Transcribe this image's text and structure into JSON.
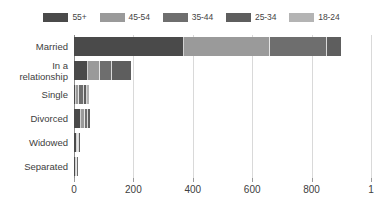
{
  "chart_data": {
    "type": "bar",
    "orientation": "horizontal",
    "stacked": true,
    "title": "",
    "subtitle": "",
    "xlabel": "",
    "ylabel": "",
    "xlim": [
      0,
      1000
    ],
    "grid": true,
    "legend_position": "top",
    "categories": [
      "Married",
      "In a relationship",
      "Single",
      "Divorced",
      "Widowed",
      "Separated"
    ],
    "category_lines": [
      [
        "Married"
      ],
      [
        "In a",
        "relationship"
      ],
      [
        "Single"
      ],
      [
        "Divorced"
      ],
      [
        "Widowed"
      ],
      [
        "Separated"
      ]
    ],
    "xticks": [
      0,
      200,
      400,
      600,
      800,
      1000
    ],
    "xtick_labels": [
      "0",
      "200",
      "400",
      "600",
      "800",
      "1"
    ],
    "series": [
      {
        "name": "55+",
        "color": "#4a4a4a",
        "values": [
          370,
          47,
          6,
          22,
          10,
          8
        ]
      },
      {
        "name": "45-54",
        "color": "#9a9a9a",
        "values": [
          290,
          40,
          12,
          16,
          4,
          2
        ]
      },
      {
        "name": "35-44",
        "color": "#6e6e6e",
        "values": [
          192,
          40,
          14,
          10,
          2,
          1
        ]
      },
      {
        "name": "25-34",
        "color": "#5e5e5e",
        "values": [
          47,
          64,
          12,
          6,
          1,
          0
        ]
      },
      {
        "name": "18-24",
        "color": "#b4b4b4",
        "values": [
          0,
          0,
          8,
          0,
          0,
          0
        ]
      }
    ],
    "totals": [
      899,
      191,
      52,
      54,
      17,
      11
    ]
  },
  "legend": {
    "items": [
      {
        "label": "55+",
        "color": "#4a4a4a"
      },
      {
        "label": "45-54",
        "color": "#9a9a9a"
      },
      {
        "label": "35-44",
        "color": "#6e6e6e"
      },
      {
        "label": "25-34",
        "color": "#5e5e5e"
      },
      {
        "label": "18-24",
        "color": "#b4b4b4"
      }
    ]
  },
  "colors": {
    "background": "#ffffff",
    "gridline": "#d9d9d9",
    "axis": "#8a8a8a",
    "text": "#404040"
  }
}
